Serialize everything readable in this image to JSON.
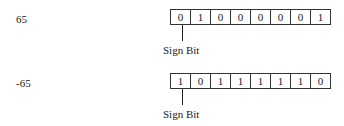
{
  "rows": [
    {
      "number": "65",
      "bits": [
        "0",
        "1",
        "0",
        "0",
        "0",
        "0",
        "0",
        "1"
      ],
      "pointer_label": "Sign Bit"
    },
    {
      "number": "-65",
      "bits": [
        "1",
        "0",
        "1",
        "1",
        "1",
        "1",
        "1",
        "0"
      ],
      "pointer_label": "Sign Bit"
    }
  ]
}
